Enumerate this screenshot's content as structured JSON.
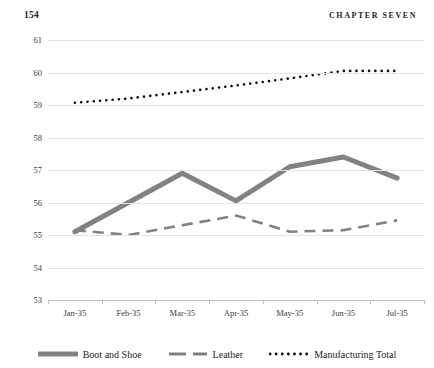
{
  "page": {
    "folio": "154",
    "running_head": "CHAPTER SEVEN"
  },
  "legend": {
    "items": [
      {
        "label": "Boot and Shoe",
        "style": "thick-solid",
        "color": "#808285"
      },
      {
        "label": "Leather",
        "style": "dashed",
        "color": "#808285"
      },
      {
        "label": "Manufacturing Total",
        "style": "dotted",
        "color": "#111111"
      }
    ]
  },
  "chart_data": {
    "type": "line",
    "title": "",
    "xlabel": "",
    "ylabel": "",
    "ylim": [
      53,
      61
    ],
    "yticks": [
      53,
      54,
      55,
      56,
      57,
      58,
      59,
      60,
      61
    ],
    "ytick_labels": [
      "53",
      "54",
      "55",
      "56",
      "57",
      "58",
      "59",
      "60",
      "61"
    ],
    "grid": true,
    "legend_position": "bottom",
    "categories": [
      "Jan-35",
      "Feb-35",
      "Mar-35",
      "Apr-35",
      "May-35",
      "Jun-35",
      "Jul-35"
    ],
    "series": [
      {
        "name": "Boot and Shoe",
        "color": "#808285",
        "style": "thick-solid",
        "values": [
          55.1,
          56.0,
          56.9,
          56.05,
          57.1,
          57.4,
          56.75
        ]
      },
      {
        "name": "Leather",
        "color": "#808285",
        "style": "dashed",
        "values": [
          55.15,
          55.0,
          55.3,
          55.6,
          55.1,
          55.15,
          55.45
        ]
      },
      {
        "name": "Manufacturing Total",
        "color": "#111111",
        "style": "dotted",
        "values": [
          59.07,
          59.2,
          59.4,
          59.6,
          59.82,
          60.05,
          60.05
        ]
      }
    ]
  }
}
